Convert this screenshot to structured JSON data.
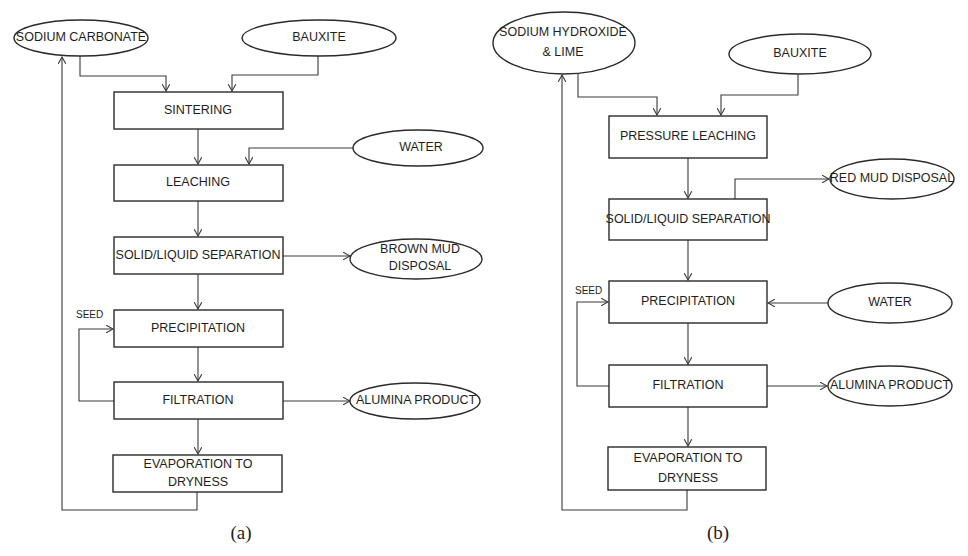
{
  "diagrams": [
    {
      "caption": "(a)",
      "inputs": {
        "reagent": "SODIUM CARBONATE",
        "ore": "BAUXITE",
        "water": "WATER"
      },
      "steps": [
        "SINTERING",
        "LEACHING",
        "SOLID/LIQUID SEPARATION",
        "PRECIPITATION",
        "FILTRATION",
        "EVAPORATION TO",
        "DRYNESS"
      ],
      "outputs": {
        "mud_line1": "BROWN MUD",
        "mud_line2": "DISPOSAL",
        "product": "ALUMINA PRODUCT"
      },
      "seed_label": "SEED"
    },
    {
      "caption": "(b)",
      "inputs": {
        "reagent_line1": "SODIUM HYDROXIDE",
        "reagent_line2": "& LIME",
        "ore": "BAUXITE",
        "water": "WATER"
      },
      "steps": [
        "PRESSURE LEACHING",
        "SOLID/LIQUID SEPARATION",
        "PRECIPITATION",
        "FILTRATION",
        "EVAPORATION TO",
        "DRYNESS"
      ],
      "outputs": {
        "mud": "RED MUD DISPOSAL",
        "product": "ALUMINA PRODUCT"
      },
      "seed_label": "SEED"
    }
  ],
  "colors": {
    "stroke": "#2a2a2a",
    "text": "#1e1e1e",
    "background": "#ffffff"
  }
}
